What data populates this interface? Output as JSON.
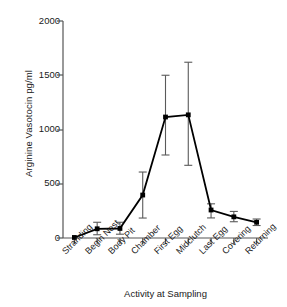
{
  "chart_data": {
    "type": "line",
    "title": "",
    "xlabel": "Activity at Sampling",
    "ylabel": "Arginine Vasotocin pg/ml",
    "ylim": [
      0,
      2000
    ],
    "yticks": [
      0,
      500,
      1000,
      1500,
      2000
    ],
    "ytick_labels": [
      "0",
      "500",
      "1000",
      "1500",
      "2000"
    ],
    "grid": false,
    "legend": null,
    "marker": "filled-square",
    "errorbars": true,
    "categories": [
      "Stranding",
      "Begin Nest",
      "Body Pit",
      "Chamber",
      "First Egg",
      "Midclutch",
      "Last Egg",
      "Covering",
      "Returning"
    ],
    "series": [
      {
        "name": "Arginine Vasotocin",
        "values": [
          5,
          85,
          88,
          396,
          1115,
          1135,
          258,
          195,
          145
        ],
        "err_low": [
          5,
          30,
          35,
          184,
          765,
          670,
          185,
          150,
          115
        ],
        "err_high": [
          5,
          145,
          145,
          608,
          1500,
          1620,
          315,
          245,
          175
        ]
      }
    ],
    "colors": {
      "line": "#000000",
      "marker": "#000000",
      "errorbar": "#5a5a5a",
      "axis": "#555555",
      "background": "#ffffff"
    }
  }
}
